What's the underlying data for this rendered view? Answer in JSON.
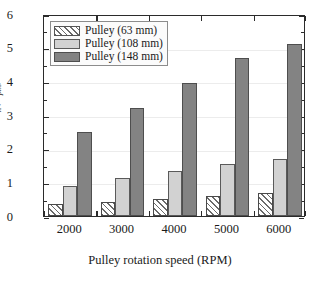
{
  "chart_data": {
    "type": "bar",
    "title": "",
    "subtitle": "",
    "xlabel": "Pulley rotation speed (RPM)",
    "ylabel": "E_n(ω_pm)",
    "ylabel_parts": {
      "main": "E",
      "main_sub": "n",
      "paren_open": "(",
      "omega": "ω",
      "omega_sub": "pm",
      "paren_close": ")"
    },
    "categories": [
      "2000",
      "3000",
      "4000",
      "5000",
      "6000"
    ],
    "ylim": [
      0,
      6
    ],
    "xlim_categories": 5,
    "y_ticks": [
      "0",
      "1",
      "2",
      "3",
      "4",
      "5",
      "6"
    ],
    "y_tick_values": [
      0,
      1,
      2,
      3,
      4,
      5,
      6
    ],
    "y_minor_tick_values": [
      0.5,
      1.5,
      2.5,
      3.5,
      4.5,
      5.5
    ],
    "grid": true,
    "grid_axis": "y",
    "legend_position": "upper-left-inside",
    "series": [
      {
        "name": "Pulley (63 mm)",
        "fill": "hatch-diagonal",
        "color": "#ffffff",
        "values": [
          0.35,
          0.42,
          0.52,
          0.6,
          0.68
        ]
      },
      {
        "name": "Pulley (108 mm)",
        "fill": "solid",
        "color": "#d2d2d2",
        "values": [
          0.88,
          1.13,
          1.35,
          1.55,
          1.7
        ]
      },
      {
        "name": "Pulley (148 mm)",
        "fill": "solid",
        "color": "#838383",
        "values": [
          2.5,
          3.22,
          3.95,
          4.68,
          5.12
        ]
      }
    ]
  },
  "legend": {
    "items": [
      {
        "label": "Pulley (63 mm)"
      },
      {
        "label": "Pulley (108 mm)"
      },
      {
        "label": "Pulley (148 mm)"
      }
    ]
  },
  "axes": {
    "x_title": "Pulley rotation speed (RPM)",
    "x_tick_labels": [
      "2000",
      "3000",
      "4000",
      "5000",
      "6000"
    ],
    "y_tick_labels": [
      "6",
      "5",
      "4",
      "3",
      "2",
      "1",
      "0"
    ]
  }
}
